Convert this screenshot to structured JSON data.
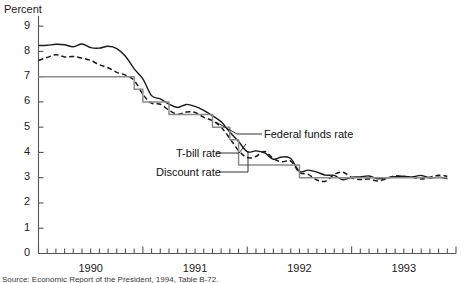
{
  "figure": {
    "y_axis_title": "Percent",
    "source_note": "Source: Economic Report of the President, 1994, Table B-72."
  },
  "annotations": {
    "federal_funds": "Federal funds rate",
    "tbill": "T-bill rate",
    "discount": "Discount rate"
  },
  "chart_data": {
    "type": "line",
    "title": "",
    "subtitle": "",
    "xlabel": "",
    "ylabel": "Percent",
    "ylim": [
      0,
      9.4
    ],
    "yticks": [
      0,
      1,
      2,
      3,
      4,
      5,
      6,
      7,
      8,
      9
    ],
    "ytick_labels": [
      "0",
      "1",
      "2",
      "3",
      "4",
      "5",
      "6",
      "7",
      "8",
      "9"
    ],
    "xlim": [
      1990.0,
      1994.0
    ],
    "xtick_labels": [
      "1990",
      "1991",
      "1992",
      "1993"
    ],
    "xtick_positions": [
      1990.5,
      1991.5,
      1992.5,
      1993.5
    ],
    "x_minor_ticks": "monthly",
    "grid": false,
    "legend_position": "inline-annotations",
    "colors": {
      "federal_funds": "#1a1a1a",
      "tbill": "#1a1a1a",
      "discount": "#8c8c8c",
      "axis": "#555555",
      "text": "#1a1a1a"
    },
    "x": [
      1990.0,
      1990.083,
      1990.167,
      1990.25,
      1990.333,
      1990.417,
      1990.5,
      1990.583,
      1990.667,
      1990.75,
      1990.833,
      1990.917,
      1991.0,
      1991.083,
      1991.167,
      1991.25,
      1991.333,
      1991.417,
      1991.5,
      1991.583,
      1991.667,
      1991.75,
      1991.833,
      1991.917,
      1992.0,
      1992.083,
      1992.167,
      1992.25,
      1992.333,
      1992.417,
      1992.5,
      1992.583,
      1992.667,
      1992.75,
      1992.833,
      1992.917,
      1993.0,
      1993.083,
      1993.167,
      1993.25,
      1993.333,
      1993.417,
      1993.5,
      1993.583,
      1993.667,
      1993.75,
      1993.833,
      1993.917
    ],
    "series": [
      {
        "name": "Federal funds rate",
        "style": "solid",
        "color": "#1a1a1a",
        "values": [
          8.23,
          8.24,
          8.28,
          8.26,
          8.18,
          8.29,
          8.15,
          8.13,
          8.2,
          8.11,
          7.81,
          7.31,
          6.91,
          6.25,
          6.12,
          5.91,
          5.78,
          5.9,
          5.82,
          5.66,
          5.45,
          5.21,
          4.81,
          4.43,
          4.03,
          4.06,
          3.98,
          3.73,
          3.82,
          3.76,
          3.25,
          3.3,
          3.22,
          3.1,
          3.09,
          2.92,
          3.02,
          3.03,
          3.07,
          2.96,
          3.0,
          3.04,
          3.06,
          3.03,
          3.09,
          2.99,
          3.02,
          2.96
        ]
      },
      {
        "name": "T-bill rate",
        "style": "dashed",
        "color": "#1a1a1a",
        "values": [
          7.64,
          7.76,
          7.87,
          7.78,
          7.8,
          7.73,
          7.64,
          7.47,
          7.35,
          7.17,
          7.06,
          6.85,
          6.3,
          5.95,
          5.91,
          5.67,
          5.51,
          5.6,
          5.58,
          5.39,
          5.26,
          5.0,
          4.56,
          4.07,
          3.8,
          3.84,
          4.04,
          3.75,
          3.63,
          3.66,
          3.21,
          3.13,
          2.91,
          2.86,
          3.13,
          3.22,
          3.0,
          2.93,
          2.95,
          2.87,
          2.96,
          3.07,
          3.04,
          3.02,
          2.95,
          3.02,
          3.1,
          3.06
        ]
      },
      {
        "name": "Discount rate",
        "style": "step",
        "color": "#8c8c8c",
        "values": [
          7.0,
          7.0,
          7.0,
          7.0,
          7.0,
          7.0,
          7.0,
          7.0,
          7.0,
          7.0,
          7.0,
          6.5,
          6.0,
          6.0,
          6.0,
          5.5,
          5.5,
          5.5,
          5.5,
          5.5,
          5.0,
          5.0,
          4.5,
          3.5,
          3.5,
          3.5,
          3.5,
          3.5,
          3.5,
          3.5,
          3.0,
          3.0,
          3.0,
          3.0,
          3.0,
          3.0,
          3.0,
          3.0,
          3.0,
          3.0,
          3.0,
          3.0,
          3.0,
          3.0,
          3.0,
          3.0,
          3.0,
          3.0
        ]
      }
    ]
  }
}
